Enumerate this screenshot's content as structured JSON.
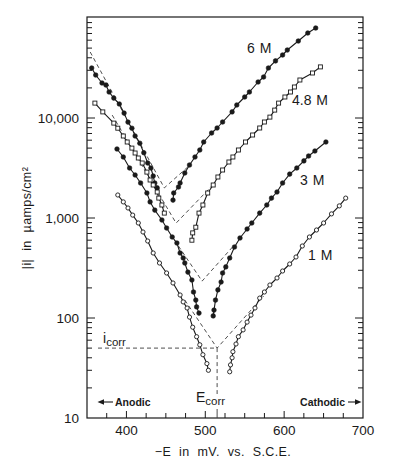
{
  "chart_data": {
    "type": "line",
    "title": "",
    "xlabel": "−E in mV. vs. S.C.E.",
    "ylabel": "|i| in µamps/cm²",
    "xlim": [
      350,
      700
    ],
    "ylim": [
      10,
      100000
    ],
    "xscale": "linear",
    "yscale": "log",
    "xticks": [
      400,
      500,
      600,
      700
    ],
    "xtick_labels": [
      "400",
      "500",
      "600",
      "700"
    ],
    "x_minor_tick_step": 25,
    "yticks": [
      10,
      100,
      1000,
      10000
    ],
    "ytick_labels": [
      "10",
      "100",
      "1,000",
      "10,000"
    ],
    "grid": false,
    "legend": "none (curves labeled directly)",
    "series": [
      {
        "name": "6 M",
        "concentration_M": 6,
        "marker": "filled-circle",
        "anodic_branch": [
          [
            356,
            31600
          ],
          [
            361,
            26900
          ],
          [
            369,
            22400
          ],
          [
            374,
            21400
          ],
          [
            378,
            18200
          ],
          [
            384,
            15800
          ],
          [
            391,
            13800
          ],
          [
            397,
            11200
          ],
          [
            402,
            9100
          ],
          [
            407,
            7900
          ],
          [
            411,
            6600
          ],
          [
            417,
            5600
          ],
          [
            422,
            4500
          ],
          [
            427,
            3550
          ],
          [
            431,
            3160
          ],
          [
            434,
            2630
          ],
          [
            436,
            2240
          ],
          [
            439,
            2000
          ]
        ],
        "cathodic_branch": [
          [
            459,
            1510
          ],
          [
            460,
            1780
          ],
          [
            466,
            2040
          ],
          [
            468,
            2240
          ],
          [
            474,
            2820
          ],
          [
            480,
            3390
          ],
          [
            487,
            4070
          ],
          [
            493,
            4790
          ],
          [
            498,
            5750
          ],
          [
            508,
            7080
          ],
          [
            515,
            7940
          ],
          [
            522,
            9120
          ],
          [
            534,
            11500
          ],
          [
            540,
            13500
          ],
          [
            550,
            16200
          ],
          [
            556,
            18200
          ],
          [
            567,
            22900
          ],
          [
            574,
            25700
          ],
          [
            580,
            31600
          ],
          [
            589,
            37200
          ],
          [
            598,
            42700
          ],
          [
            604,
            47900
          ],
          [
            618,
            58900
          ],
          [
            630,
            70800
          ],
          [
            640,
            79400
          ]
        ],
        "tafel_extrapolation": [
          [
            354,
            45700
          ],
          [
            448,
            2000
          ],
          [
            478,
            3240
          ]
        ]
      },
      {
        "name": "4.8 M",
        "concentration_M": 4.8,
        "marker": "open-square",
        "anodic_branch": [
          [
            360,
            14100
          ],
          [
            370,
            11500
          ],
          [
            384,
            8900
          ],
          [
            389,
            7900
          ],
          [
            396,
            6600
          ],
          [
            401,
            5750
          ],
          [
            407,
            5000
          ],
          [
            411,
            4470
          ],
          [
            415,
            3980
          ],
          [
            420,
            3550
          ],
          [
            426,
            2880
          ],
          [
            430,
            2400
          ],
          [
            434,
            2140
          ],
          [
            439,
            1820
          ],
          [
            441,
            1580
          ],
          [
            445,
            1350
          ],
          [
            448,
            1120
          ]
        ],
        "cathodic_branch": [
          [
            483,
            600
          ],
          [
            484,
            710
          ],
          [
            488,
            810
          ],
          [
            492,
            1120
          ],
          [
            497,
            1350
          ],
          [
            503,
            1780
          ],
          [
            510,
            2140
          ],
          [
            516,
            2570
          ],
          [
            522,
            3020
          ],
          [
            530,
            3630
          ],
          [
            535,
            4070
          ],
          [
            542,
            4790
          ],
          [
            551,
            5750
          ],
          [
            560,
            6760
          ],
          [
            569,
            7940
          ],
          [
            575,
            9120
          ],
          [
            582,
            10200
          ],
          [
            588,
            12000
          ],
          [
            593,
            14100
          ],
          [
            601,
            16200
          ],
          [
            608,
            18200
          ],
          [
            613,
            20400
          ],
          [
            620,
            24000
          ],
          [
            636,
            28200
          ],
          [
            646,
            32400
          ]
        ],
        "tafel_extrapolation": [
          [
            382,
            10700
          ],
          [
            463,
            890
          ],
          [
            512,
            2240
          ]
        ]
      },
      {
        "name": "3 M",
        "concentration_M": 3,
        "marker": "filled-circle",
        "anodic_branch": [
          [
            388,
            4900
          ],
          [
            396,
            4070
          ],
          [
            404,
            3160
          ],
          [
            411,
            2690
          ],
          [
            418,
            2240
          ],
          [
            426,
            1780
          ],
          [
            430,
            1450
          ],
          [
            436,
            1200
          ],
          [
            445,
            955
          ],
          [
            451,
            794
          ],
          [
            458,
            646
          ],
          [
            464,
            562
          ],
          [
            468,
            447
          ],
          [
            472,
            398
          ],
          [
            474,
            355
          ],
          [
            478,
            288
          ],
          [
            483,
            240
          ],
          [
            485,
            182
          ],
          [
            488,
            151
          ],
          [
            489,
            129
          ],
          [
            492,
            112
          ]
        ],
        "cathodic_branch": [
          [
            510,
            105
          ],
          [
            511,
            120
          ],
          [
            513,
            151
          ],
          [
            516,
            191
          ],
          [
            520,
            229
          ],
          [
            522,
            282
          ],
          [
            526,
            324
          ],
          [
            531,
            398
          ],
          [
            537,
            513
          ],
          [
            544,
            631
          ],
          [
            553,
            776
          ],
          [
            559,
            891
          ],
          [
            569,
            1120
          ],
          [
            578,
            1350
          ],
          [
            584,
            1580
          ],
          [
            591,
            1820
          ],
          [
            598,
            2240
          ],
          [
            607,
            2750
          ],
          [
            616,
            3160
          ],
          [
            625,
            3720
          ],
          [
            631,
            4170
          ],
          [
            639,
            4680
          ],
          [
            653,
            5750
          ]
        ],
        "tafel_extrapolation": [
          [
            461,
            600
          ],
          [
            496,
            234
          ],
          [
            537,
            540
          ]
        ]
      },
      {
        "name": "1 M",
        "concentration_M": 1,
        "marker": "open-circle",
        "anodic_branch": [
          [
            389,
            1700
          ],
          [
            396,
            1450
          ],
          [
            402,
            1260
          ],
          [
            408,
            1070
          ],
          [
            415,
            891
          ],
          [
            421,
            724
          ],
          [
            427,
            589
          ],
          [
            434,
            447
          ],
          [
            442,
            355
          ],
          [
            451,
            282
          ],
          [
            459,
            224
          ],
          [
            468,
            170
          ],
          [
            472,
            145
          ],
          [
            477,
            126
          ],
          [
            480,
            102
          ],
          [
            484,
            81
          ],
          [
            489,
            65
          ],
          [
            493,
            54
          ],
          [
            497,
            43
          ],
          [
            502,
            35
          ],
          [
            504,
            30
          ]
        ],
        "cathodic_branch": [
          [
            531,
            29
          ],
          [
            532,
            34
          ],
          [
            534,
            40
          ],
          [
            535,
            46
          ],
          [
            539,
            55
          ],
          [
            542,
            65
          ],
          [
            548,
            76
          ],
          [
            553,
            91
          ],
          [
            558,
            107
          ],
          [
            563,
            126
          ],
          [
            569,
            158
          ],
          [
            575,
            182
          ],
          [
            582,
            214
          ],
          [
            591,
            251
          ],
          [
            598,
            295
          ],
          [
            607,
            347
          ],
          [
            615,
            407
          ],
          [
            623,
            525
          ],
          [
            632,
            646
          ],
          [
            641,
            759
          ],
          [
            650,
            891
          ],
          [
            660,
            1100
          ],
          [
            670,
            1320
          ],
          [
            678,
            1580
          ]
        ],
        "tafel_extrapolation": [
          [
            474,
            151
          ],
          [
            515,
            50
          ],
          [
            574,
            166
          ]
        ]
      }
    ],
    "corrosion": {
      "i_corr": 50,
      "E_corr": 515,
      "i_symbol": "i",
      "i_subscript": "corr",
      "E_symbol": "E",
      "E_subscript": "corr"
    },
    "annotations": {
      "anodic": {
        "text": "Anodic",
        "icon": "arrow-left"
      },
      "cathodic": {
        "text": "Cathodic",
        "icon": "arrow-right"
      }
    }
  }
}
